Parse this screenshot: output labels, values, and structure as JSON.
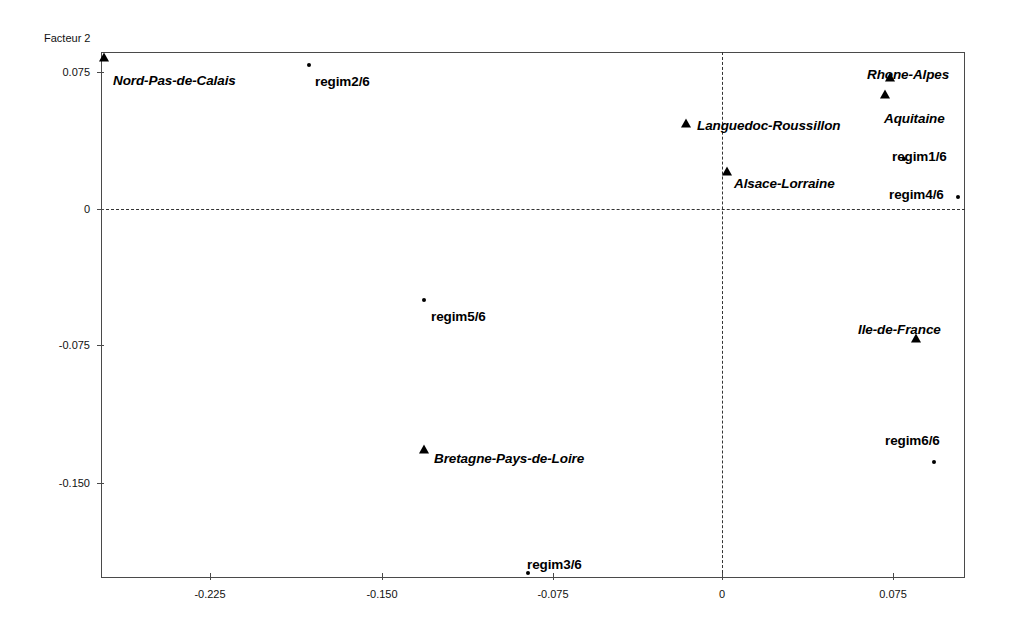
{
  "chart_data": {
    "type": "scatter",
    "title": "",
    "ylabel": "Facteur 2",
    "xlabel": "",
    "xlim": [
      -0.2695,
      0.1066
    ],
    "ylim": [
      -0.1958,
      0.0827
    ],
    "xticks": [
      -0.225,
      -0.15,
      -0.075,
      0,
      0.075
    ],
    "xtick_labels": [
      "-0.225",
      "-0.150",
      "-0.075",
      "0",
      "0.075"
    ],
    "yticks": [
      0.075,
      0,
      -0.075,
      -0.15
    ],
    "ytick_labels": [
      "0.075",
      "0",
      "-0.075",
      "-0.150"
    ],
    "grid": false,
    "legend": "none",
    "reference_lines": [
      {
        "axis": "horizontal",
        "value": 0,
        "style": "dashed"
      },
      {
        "axis": "vertical",
        "value": 0,
        "style": "dashed"
      }
    ],
    "series": [
      {
        "name": "regions",
        "marker": "triangle",
        "points": [
          {
            "label": "Nord-Pas-de-Calais",
            "x": -0.2688,
            "y": 0.0805,
            "px": 104,
            "py": 58,
            "lx": 113,
            "ly": 74
          },
          {
            "label": "Rhone-Alpes",
            "x": 0.0737,
            "y": 0.0717,
            "px": 890,
            "py": 78,
            "lx": 867,
            "ly": 68
          },
          {
            "label": "Aquitaine",
            "x": 0.0715,
            "y": 0.0624,
            "px": 885,
            "py": 95,
            "lx": 884,
            "ly": 112
          },
          {
            "label": "Languedoc-Roussillon",
            "x": -0.0158,
            "y": 0.0465,
            "px": 686,
            "py": 124,
            "lx": 697,
            "ly": 119
          },
          {
            "label": "Alsace-Lorraine",
            "x": 0.0022,
            "y": 0.0202,
            "px": 727,
            "py": 172,
            "lx": 734,
            "ly": 177
          },
          {
            "label": "Ile-de-France",
            "x": 0.0851,
            "y": -0.0712,
            "px": 916,
            "py": 339,
            "lx": 858,
            "ly": 323
          },
          {
            "label": "Bretagne-Pays-de-Loire",
            "x": -0.1308,
            "y": -0.1319,
            "px": 424,
            "py": 450,
            "lx": 434,
            "ly": 452
          }
        ]
      },
      {
        "name": "regimes",
        "marker": "dot",
        "points": [
          {
            "label": "regim2/6",
            "x": -0.1872,
            "y": 0.0767,
            "px": 309,
            "py": 65,
            "lx": 315,
            "ly": 75
          },
          {
            "label": "regim1/6",
            "x": 0.0798,
            "y": 0.0274,
            "px": 904,
            "py": 159,
            "lx": 892,
            "ly": 150
          },
          {
            "label": "regim4/6",
            "x": 0.1035,
            "y": 0.0066,
            "px": 958,
            "py": 197,
            "lx": 889,
            "ly": 188
          },
          {
            "label": "regim5/6",
            "x": -0.1307,
            "y": -0.0498,
            "px": 424,
            "py": 300,
            "lx": 431,
            "ly": 310
          },
          {
            "label": "regim6/6",
            "x": 0.0925,
            "y": -0.1384,
            "px": 934,
            "py": 462,
            "lx": 885,
            "ly": 434
          },
          {
            "label": "regim3/6",
            "x": -0.0851,
            "y": -0.1993,
            "px": 528,
            "py": 573,
            "lx": 527,
            "ly": 558
          }
        ]
      }
    ]
  },
  "axes": {
    "y_axis_title": "Facteur 2",
    "x_tick_labels": [
      "-0.225",
      "-0.150",
      "-0.075",
      "0",
      "0.075"
    ],
    "y_tick_labels": [
      "0.075",
      "0",
      "-0.075",
      "-0.150"
    ]
  },
  "colors": {
    "marker": "#000000",
    "frame": "#4a4a4a",
    "reference_line": "#333333",
    "background": "#ffffff"
  }
}
